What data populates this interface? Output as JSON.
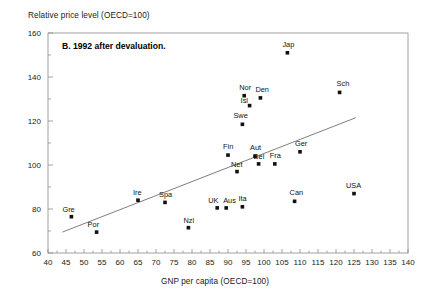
{
  "chart_data": {
    "type": "scatter",
    "title": "B. 1992 after devaluation.",
    "xlabel": "GNP per capita (OECD=100)",
    "ylabel": "Relative price level (OECD=100)",
    "xlim": [
      40,
      140
    ],
    "ylim": [
      60,
      160
    ],
    "xticks": [
      40,
      45,
      50,
      55,
      60,
      65,
      70,
      75,
      80,
      85,
      90,
      95,
      100,
      105,
      110,
      115,
      120,
      125,
      130,
      135,
      140
    ],
    "yticks": [
      60,
      80,
      100,
      120,
      140,
      160
    ],
    "yminorticks": [
      70,
      90,
      110,
      130,
      150
    ],
    "grid": false,
    "legend": false,
    "points": [
      {
        "label": "Gre",
        "x": 46.5,
        "y": 76.5,
        "label_dx": -9,
        "label_dy": -5
      },
      {
        "label": "Por",
        "x": 53.5,
        "y": 69.5,
        "label_dx": -9,
        "label_dy": -5
      },
      {
        "label": "Ire",
        "x": 65.0,
        "y": 84.0,
        "label_dx": -5,
        "label_dy": -5
      },
      {
        "label": "Spa",
        "x": 72.5,
        "y": 83.0,
        "label_dx": -6,
        "label_dy": -5
      },
      {
        "label": "Nzl",
        "x": 79.0,
        "y": 71.5,
        "label_dx": -5,
        "label_dy": -5
      },
      {
        "label": "UK",
        "x": 87.0,
        "y": 80.5,
        "label_dx": -9,
        "label_dy": -5
      },
      {
        "label": "Aus",
        "x": 89.5,
        "y": 80.5,
        "label_dx": -3,
        "label_dy": -5
      },
      {
        "label": "Ita",
        "x": 94.0,
        "y": 81.0,
        "label_dx": -4,
        "label_dy": -6
      },
      {
        "label": "Fin",
        "x": 90.0,
        "y": 104.5,
        "label_dx": -5,
        "label_dy": -6
      },
      {
        "label": "Net",
        "x": 92.5,
        "y": 97.0,
        "label_dx": -6,
        "label_dy": -5
      },
      {
        "label": "Aut",
        "x": 97.5,
        "y": 104.0,
        "label_dx": -5,
        "label_dy": -6
      },
      {
        "label": "Bel",
        "x": 98.5,
        "y": 100.5,
        "label_dx": -5,
        "label_dy": -5
      },
      {
        "label": "Fra",
        "x": 103.0,
        "y": 100.5,
        "label_dx": -5,
        "label_dy": -6
      },
      {
        "label": "Ger",
        "x": 110.0,
        "y": 106.0,
        "label_dx": -5,
        "label_dy": -6
      },
      {
        "label": "Can",
        "x": 108.5,
        "y": 83.5,
        "label_dx": -5,
        "label_dy": -6
      },
      {
        "label": "USA",
        "x": 125.0,
        "y": 87.0,
        "label_dx": -8,
        "label_dy": -6
      },
      {
        "label": "Swe",
        "x": 94.0,
        "y": 118.5,
        "label_dx": -9,
        "label_dy": -6
      },
      {
        "label": "Isl",
        "x": 96.0,
        "y": 127.0,
        "label_dx": -9,
        "label_dy": -3
      },
      {
        "label": "Nor",
        "x": 94.5,
        "y": 131.5,
        "label_dx": -5,
        "label_dy": -6
      },
      {
        "label": "Den",
        "x": 99.0,
        "y": 130.5,
        "label_dx": -5,
        "label_dy": -6
      },
      {
        "label": "Jap",
        "x": 106.5,
        "y": 151.0,
        "label_dx": -5,
        "label_dy": -6
      },
      {
        "label": "Sch",
        "x": 121.0,
        "y": 133.0,
        "label_dx": -3,
        "label_dy": -6
      }
    ],
    "trendline": {
      "x0": 44.0,
      "y0": 69.5,
      "x1": 125.5,
      "y1": 121.5
    }
  }
}
